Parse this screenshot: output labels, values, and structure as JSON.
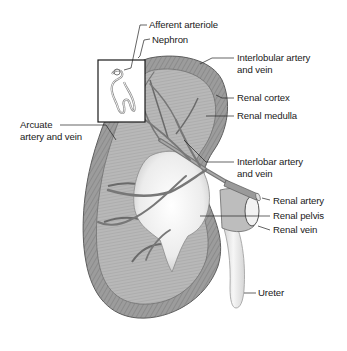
{
  "diagram": {
    "colors": {
      "background": "#ffffff",
      "cortex": "#9a9a9a",
      "cortex_dark": "#6e6e6e",
      "medulla": "#b4b4b4",
      "pelvis": "#ececec",
      "vessel": "#7d7d7d",
      "ureter": "#e6e6e6",
      "leader_line": "#222222",
      "text": "#1a1a1a"
    },
    "labels": [
      {
        "id": "afferent-arteriole",
        "lines": [
          "Afferent arteriole"
        ]
      },
      {
        "id": "nephron",
        "lines": [
          "Nephron"
        ]
      },
      {
        "id": "interlobular-artery-vein",
        "lines": [
          "Interlobular artery",
          "and vein"
        ]
      },
      {
        "id": "renal-cortex",
        "lines": [
          "Renal cortex"
        ]
      },
      {
        "id": "renal-medulla",
        "lines": [
          "Renal medulla"
        ]
      },
      {
        "id": "arcuate-artery-vein",
        "lines": [
          "Arcuate",
          "artery and vein"
        ]
      },
      {
        "id": "interlobar-artery-vein",
        "lines": [
          "Interlobar artery",
          "and vein"
        ]
      },
      {
        "id": "renal-artery",
        "lines": [
          "Renal artery"
        ]
      },
      {
        "id": "renal-pelvis",
        "lines": [
          "Renal pelvis"
        ]
      },
      {
        "id": "renal-vein",
        "lines": [
          "Renal vein"
        ]
      },
      {
        "id": "ureter",
        "lines": [
          "Ureter"
        ]
      }
    ]
  }
}
